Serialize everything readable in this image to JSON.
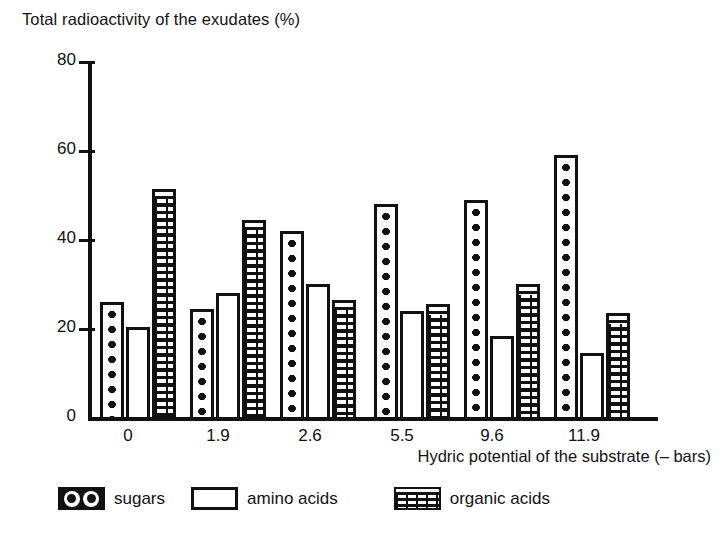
{
  "chart_data": {
    "type": "bar",
    "title": "Total radioactivity of the exudates (%)",
    "xlabel": "Hydric potential of the substrate (– bars)",
    "ylabel": "Total radioactivity of the exudates (%)",
    "categories": [
      "0",
      "1.9",
      "2.6",
      "5.5",
      "9.6",
      "11.9"
    ],
    "series": [
      {
        "name": "sugars",
        "values": [
          26.5,
          25,
          42.5,
          48.5,
          49.5,
          59.5
        ]
      },
      {
        "name": "amino acids",
        "values": [
          21,
          28.5,
          30.5,
          24.5,
          19,
          15
        ]
      },
      {
        "name": "organic acids",
        "values": [
          52,
          45,
          27,
          26,
          30.5,
          24
        ]
      }
    ],
    "ylim": [
      0,
      80
    ],
    "yticks": [
      "0",
      "20",
      "40",
      "60",
      "80"
    ],
    "ytick_values": [
      0,
      20,
      40,
      60,
      80
    ],
    "grid": false,
    "legend_position": "bottom"
  },
  "legend": {
    "items": [
      {
        "label": "sugars",
        "pattern": "dots",
        "color": "#111111"
      },
      {
        "label": "amino acids",
        "pattern": "empty",
        "color": "#ffffff"
      },
      {
        "label": "organic acids",
        "pattern": "bricks",
        "color": "#111111"
      }
    ]
  },
  "axes": {
    "y_tick_labels": [
      "80",
      "60",
      "40",
      "20",
      "0"
    ],
    "x_tick_labels": [
      "0",
      "1.9",
      "2.6",
      "5.5",
      "9.6",
      "11.9"
    ],
    "x_axis_title": "Hydric potential of the substrate (– bars)",
    "y_axis_title": "Total radioactivity of the exudates (%)"
  }
}
